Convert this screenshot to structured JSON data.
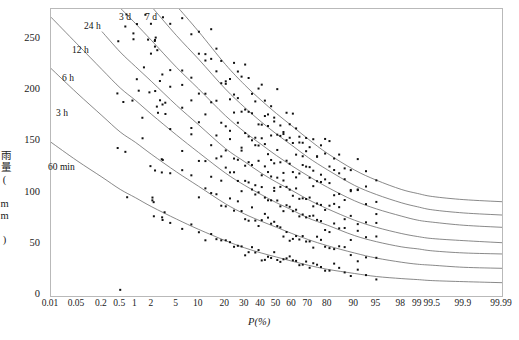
{
  "chart_data": {
    "type": "line",
    "title": "",
    "xlabel": "P(%)",
    "ylabel": "雨量( mm )",
    "ylim": [
      0,
      280
    ],
    "yticks": [
      0,
      50,
      100,
      150,
      200,
      250
    ],
    "xscale": "probability",
    "xticks": [
      "0.01",
      "0.05",
      "0.2",
      "0.5",
      "1",
      "2",
      "5",
      "10",
      "20",
      "30",
      "40",
      "50",
      "60",
      "70",
      "80",
      "90",
      "95",
      "98",
      "99",
      "99.5",
      "99.9",
      "99.99"
    ],
    "xtick_positions": [
      0.01,
      0.05,
      0.2,
      0.5,
      1,
      2,
      5,
      10,
      20,
      30,
      40,
      50,
      60,
      70,
      80,
      90,
      95,
      98,
      99,
      99.5,
      99.9,
      99.99
    ],
    "grid": false,
    "legend_position": "inline-curve-labels",
    "series": [
      {
        "name": "60 min",
        "label": "60 min",
        "color": "#6b6b6b",
        "x": [
          0.01,
          0.05,
          0.2,
          0.5,
          1,
          2,
          5,
          10,
          20,
          30,
          40,
          50,
          60,
          70,
          80,
          90,
          95,
          98,
          99,
          99.5,
          99.9,
          99.99
        ],
        "y": [
          150,
          132,
          116,
          104,
          96,
          87,
          75,
          65,
          54,
          47,
          42,
          38,
          34,
          30,
          26,
          22,
          19,
          17,
          16,
          15,
          14,
          13
        ]
      },
      {
        "name": "3 h",
        "label": "3 h",
        "color": "#6b6b6b",
        "x": [
          0.01,
          0.05,
          0.2,
          0.5,
          1,
          2,
          5,
          10,
          20,
          30,
          40,
          50,
          60,
          70,
          80,
          90,
          95,
          98,
          99,
          99.5,
          99.9,
          99.99
        ],
        "y": [
          222,
          198,
          176,
          160,
          150,
          138,
          121,
          107,
          90,
          80,
          73,
          67,
          61,
          55,
          49,
          42,
          37,
          33,
          31,
          30,
          28,
          27
        ]
      },
      {
        "name": "6 h",
        "label": "6 h",
        "color": "#6b6b6b",
        "x": [
          0.01,
          0.05,
          0.2,
          0.5,
          1,
          2,
          5,
          10,
          20,
          30,
          40,
          50,
          60,
          70,
          80,
          90,
          95,
          98,
          99,
          99.5,
          99.9,
          99.99
        ],
        "y": [
          272,
          246,
          221,
          203,
          191,
          177,
          157,
          140,
          120,
          108,
          99,
          91,
          84,
          76,
          69,
          59,
          53,
          48,
          46,
          44,
          42,
          41
        ]
      },
      {
        "name": "12 h",
        "label": "12 h",
        "color": "#6b6b6b",
        "x": [
          0.05,
          0.2,
          0.5,
          1,
          2,
          5,
          10,
          20,
          30,
          40,
          50,
          60,
          70,
          80,
          90,
          95,
          98,
          99,
          99.5,
          99.9,
          99.99
        ],
        "y": [
          285,
          258,
          238,
          224,
          209,
          186,
          167,
          144,
          131,
          120,
          111,
          103,
          94,
          85,
          74,
          67,
          61,
          58,
          56,
          54,
          52
        ]
      },
      {
        "name": "24 h",
        "label": "24 h",
        "color": "#6b6b6b",
        "x": [
          0.5,
          1,
          2,
          5,
          10,
          20,
          30,
          40,
          50,
          60,
          70,
          80,
          90,
          95,
          98,
          99,
          99.5,
          99.9,
          99.99
        ],
        "y": [
          281,
          266,
          249,
          223,
          202,
          176,
          160,
          148,
          137,
          127,
          117,
          106,
          93,
          85,
          78,
          74,
          72,
          69,
          67
        ]
      },
      {
        "name": "3 d",
        "label": "3 d",
        "color": "#6b6b6b",
        "x": [
          2,
          5,
          10,
          20,
          30,
          40,
          50,
          60,
          70,
          80,
          90,
          95,
          98,
          99,
          99.5,
          99.9,
          99.99
        ],
        "y": [
          282,
          254,
          231,
          202,
          184,
          170,
          158,
          147,
          135,
          123,
          108,
          99,
          91,
          87,
          84,
          81,
          79
        ]
      },
      {
        "name": "7 d",
        "label": "7 d",
        "color": "#6b6b6b",
        "x": [
          5,
          10,
          20,
          30,
          40,
          50,
          60,
          70,
          80,
          90,
          95,
          98,
          99,
          99.5,
          99.9,
          99.99
        ],
        "y": [
          283,
          258,
          226,
          206,
          191,
          178,
          166,
          153,
          139,
          123,
          113,
          104,
          100,
          97,
          94,
          92
        ]
      }
    ],
    "scatter_note": "observed annual maxima plotted by plotting position",
    "marker_color": "#111111",
    "marker_size": 2,
    "curve_labels": [
      {
        "text": "60 min",
        "x_px": 48,
        "y_px": 162
      },
      {
        "text": "3 h",
        "x_px": 56,
        "y_px": 108
      },
      {
        "text": "6 h",
        "x_px": 62,
        "y_px": 73
      },
      {
        "text": "12 h",
        "x_px": 72,
        "y_px": 45
      },
      {
        "text": "24 h",
        "x_px": 84,
        "y_px": 21
      },
      {
        "text": "3 d",
        "x_px": 119,
        "y_px": 12
      },
      {
        "text": "7 d",
        "x_px": 145,
        "y_px": 12
      }
    ]
  }
}
